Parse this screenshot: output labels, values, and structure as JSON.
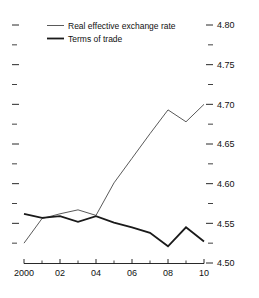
{
  "chart_data": {
    "type": "line",
    "title": "",
    "subtitle": "",
    "xlabel": "",
    "ylabel": "",
    "xlim": [
      2000,
      2010
    ],
    "ylim": [
      4.5,
      4.8
    ],
    "grid": false,
    "legend_position": "top-left",
    "y_axis_side": "right",
    "y_ticks": [
      4.5,
      4.55,
      4.6,
      4.65,
      4.7,
      4.75,
      4.8
    ],
    "y_tick_labels": [
      "4.50",
      "4.55",
      "4.60",
      "4.65",
      "4.70",
      "4.75",
      "4.80"
    ],
    "y_minor_ticks": [
      4.525,
      4.575,
      4.625,
      4.675,
      4.725,
      4.775
    ],
    "x": [
      2000,
      2001,
      2002,
      2003,
      2004,
      2005,
      2006,
      2007,
      2008,
      2009,
      2010
    ],
    "x_ticks": [
      2000,
      2002,
      2004,
      2006,
      2008,
      2010
    ],
    "x_tick_labels": [
      "2000",
      "02",
      "04",
      "06",
      "08",
      "10"
    ],
    "x_minor_ticks": [
      2001,
      2003,
      2005,
      2007,
      2009
    ],
    "series": [
      {
        "name": "Real effective exchange rate",
        "color": "#5a5a5a",
        "width": "thin",
        "values": [
          4.525,
          4.556,
          4.562,
          4.567,
          4.56,
          4.601,
          4.632,
          4.663,
          4.693,
          4.678,
          4.7
        ]
      },
      {
        "name": "Terms of trade",
        "color": "#1a1a1a",
        "width": "thick",
        "values": [
          4.562,
          4.557,
          4.559,
          4.552,
          4.559,
          4.551,
          4.545,
          4.538,
          4.521,
          4.545,
          4.527
        ]
      }
    ]
  },
  "legend": {
    "items": [
      {
        "label": "Real effective exchange rate"
      },
      {
        "label": "Terms of trade"
      }
    ]
  }
}
